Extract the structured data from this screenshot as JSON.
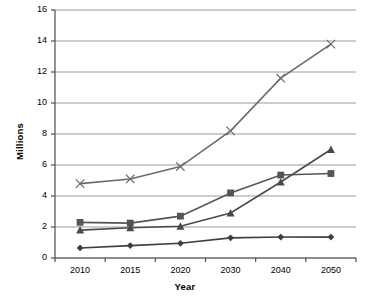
{
  "chart_data": {
    "type": "line",
    "title": "",
    "xlabel": "Year",
    "ylabel": "Millions",
    "categories": [
      "2010",
      "2015",
      "2020",
      "2030",
      "2040",
      "2050"
    ],
    "ylim": [
      0,
      16
    ],
    "ytick_values": [
      0,
      2,
      4,
      6,
      8,
      10,
      12,
      14,
      16
    ],
    "ytick_labels": [
      "0",
      "2",
      "4",
      "6",
      "8",
      "10",
      "12",
      "14",
      "16"
    ],
    "grid": "horizontal",
    "legend": "none",
    "series": [
      {
        "name": "series-x-cross",
        "marker": "x",
        "color": "#6b6b6b",
        "values": [
          4.8,
          5.1,
          5.9,
          8.2,
          11.6,
          13.8
        ]
      },
      {
        "name": "series-square",
        "marker": "square",
        "color": "#555555",
        "values": [
          2.3,
          2.25,
          2.7,
          4.2,
          5.35,
          5.45
        ]
      },
      {
        "name": "series-triangle",
        "marker": "triangle",
        "color": "#4a4a4a",
        "values": [
          1.8,
          1.95,
          2.05,
          2.9,
          4.9,
          7.0
        ]
      },
      {
        "name": "series-diamond",
        "marker": "diamond",
        "color": "#3f3f3f",
        "values": [
          0.65,
          0.8,
          0.95,
          1.3,
          1.35,
          1.35
        ]
      }
    ]
  },
  "axis": {
    "y_title": "Millions",
    "x_title": "Year"
  }
}
